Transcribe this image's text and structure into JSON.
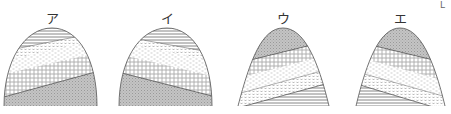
{
  "figures": [
    {
      "label": "ア",
      "cx": 52,
      "layers_top_to_bottom": [
        "horizontal-lines",
        "dotted-v",
        "light-dashed",
        "circles",
        "gray-stipple"
      ],
      "dip": "rising-right"
    },
    {
      "label": "イ",
      "cx": 167,
      "layers_top_to_bottom": [
        "horizontal-lines",
        "dotted-v",
        "light-dashed",
        "circles",
        "gray-stipple"
      ],
      "dip": "falling-right"
    },
    {
      "label": "ウ",
      "cx": 283,
      "layers_top_to_bottom": [
        "gray-stipple",
        "circles",
        "light-dashed",
        "dotted-v",
        "horizontal-lines"
      ],
      "dip": "rising-right"
    },
    {
      "label": "エ",
      "cx": 400,
      "layers_top_to_bottom": [
        "gray-stipple",
        "circles",
        "light-dashed",
        "dotted-v",
        "horizontal-lines"
      ],
      "dip": "falling-right"
    }
  ],
  "corner_mark": "L"
}
